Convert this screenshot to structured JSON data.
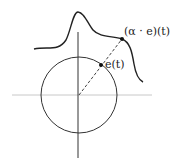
{
  "diagram": {
    "labels": {
      "unit_point": "e(t)",
      "scaled_point": "(α · e)(t)"
    },
    "colors": {
      "axis": "#c8c8c8",
      "vertical_axis": "#333333",
      "circle": "#333333",
      "curve": "#222222",
      "ray": "#444444",
      "points": "#111111"
    }
  }
}
